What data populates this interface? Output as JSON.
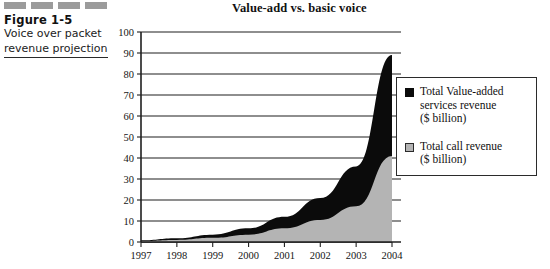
{
  "caption": {
    "figure_number": "Figure 1-5",
    "lines": [
      "Voice over packet",
      "revenue projection"
    ]
  },
  "legend": {
    "position": "right",
    "entries": [
      {
        "swatch": "black",
        "color": "#0b0b0b",
        "lines": [
          "Total Value-added",
          "services revenue",
          "($ billion)"
        ]
      },
      {
        "swatch": "gray",
        "color": "#b4b4b4",
        "lines": [
          "Total call revenue",
          "($ billion)"
        ]
      }
    ]
  },
  "chart_data": {
    "type": "area",
    "stacked": true,
    "title": "Value-add vs. basic voice",
    "xlabel": "",
    "ylabel": "",
    "categories": [
      "1997",
      "1998",
      "1999",
      "2000",
      "2001",
      "2002",
      "2003",
      "2004"
    ],
    "x": [
      1997,
      1998,
      1999,
      2000,
      2001,
      2002,
      2003,
      2004
    ],
    "ylim": [
      0,
      100
    ],
    "yticks": [
      0,
      10,
      20,
      30,
      40,
      50,
      60,
      70,
      80,
      90,
      100
    ],
    "ytick_labels": [
      "0",
      "10",
      "20",
      "30",
      "40",
      "50",
      "60",
      "70",
      "80",
      "90",
      "100"
    ],
    "grid": "horizontal",
    "series": [
      {
        "name": "Total call revenue ($ billion)",
        "color": "#b4b4b4",
        "values": [
          0.5,
          1,
          2,
          3.5,
          6.5,
          10.5,
          17,
          41
        ]
      },
      {
        "name": "Total Value-added services revenue ($ billion)",
        "color": "#0b0b0b",
        "values": [
          0.3,
          0.8,
          1.5,
          3,
          5.5,
          10.5,
          19,
          48
        ]
      }
    ],
    "totals": [
      0.8,
      1.8,
      3.5,
      6.5,
      12,
      21,
      36,
      89
    ]
  }
}
